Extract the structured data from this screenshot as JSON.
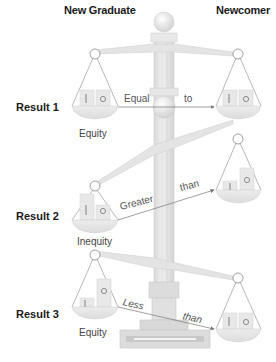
{
  "diagram": {
    "type": "balance-scale comparison",
    "headers": {
      "left": "New Graduate",
      "right": "Newcomer"
    },
    "results": [
      {
        "label": "Result 1",
        "relation_word_1": "Equal",
        "relation_word_2": "to",
        "outcome": "Equity"
      },
      {
        "label": "Result 2",
        "relation_word_1": "Greater",
        "relation_word_2": "than",
        "outcome": "Inequity"
      },
      {
        "label": "Result 3",
        "relation_word_1": "Less",
        "relation_word_2": "than",
        "outcome": "Equity"
      }
    ],
    "pan_symbols": {
      "input": "I",
      "outcome": "O"
    },
    "colors": {
      "pole": "#e6e6e6",
      "pole_edge": "#c8c8c8",
      "pan": "#e2e2e2",
      "line": "#8a8a8a",
      "text": "#1a1a1a"
    }
  }
}
